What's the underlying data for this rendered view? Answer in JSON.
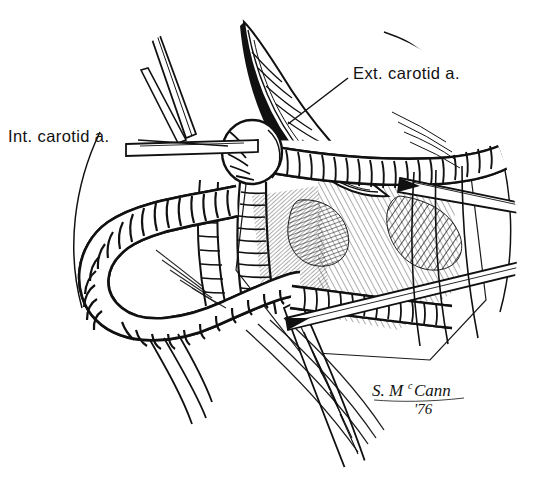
{
  "figure": {
    "medium": "pen-and-ink line illustration",
    "background_color": "#ffffff",
    "ink_color": "#111111",
    "width": 544,
    "height": 489
  },
  "labels": [
    {
      "id": "int-carotid",
      "text": "Int. carotid a.",
      "x": 8,
      "y": 128,
      "leader": "horizontal line extending right from label toward vessel"
    },
    {
      "id": "ext-carotid",
      "text": "Ext. carotid a.",
      "x": 353,
      "y": 65,
      "leader": "diagonal line extending down-left from label toward vessel"
    }
  ],
  "signature": {
    "name": "S. MᶜCann",
    "surname_prefix": "S. M",
    "surname_superscript": "c",
    "surname_rest": "Cann",
    "year": "'76"
  },
  "structures": [
    {
      "name": "internal-carotid-artery",
      "note": "large looped vessel, left of field"
    },
    {
      "name": "external-carotid-artery",
      "note": "vessel crossing upper right of field"
    },
    {
      "name": "retracted-tissue-flap",
      "note": "pointed flap at top center"
    },
    {
      "name": "retractor-instrument-upper-left",
      "note": "thin instrument entering top left"
    },
    {
      "name": "pointed-instrument-upper-right",
      "note": "tapered instrument entering right"
    },
    {
      "name": "pointed-instrument-lower-right",
      "note": "tapered instrument entering lower right"
    },
    {
      "name": "vignette-boundary",
      "note": "thin oval field-of-view outline"
    }
  ]
}
